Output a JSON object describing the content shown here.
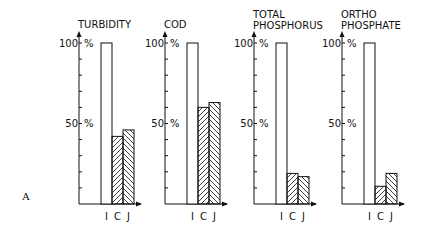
{
  "figure_label": "A",
  "chart_data": [
    {
      "type": "bar",
      "title": "TURBIDITY",
      "title_lines": [
        "TURBIDITY"
      ],
      "categories": [
        "I",
        "C",
        "J"
      ],
      "values": [
        100,
        42,
        46
      ],
      "ylim": [
        0,
        100
      ],
      "yticks": [
        {
          "value": 100,
          "label": "100",
          "unit": "%"
        },
        {
          "value": 50,
          "label": "50",
          "unit": "%"
        }
      ],
      "xlabel": "",
      "ylabel": ""
    },
    {
      "type": "bar",
      "title": "COD",
      "title_lines": [
        "COD"
      ],
      "categories": [
        "I",
        "C",
        "J"
      ],
      "values": [
        100,
        60,
        63
      ],
      "ylim": [
        0,
        100
      ],
      "yticks": [
        {
          "value": 100,
          "label": "100",
          "unit": "%"
        },
        {
          "value": 50,
          "label": "50",
          "unit": "%"
        }
      ],
      "xlabel": "",
      "ylabel": ""
    },
    {
      "type": "bar",
      "title": "TOTAL PHOSPHORUS",
      "title_lines": [
        "TOTAL",
        "PHOSPHORUS"
      ],
      "categories": [
        "I",
        "C",
        "J"
      ],
      "values": [
        100,
        19,
        17
      ],
      "ylim": [
        0,
        100
      ],
      "yticks": [
        {
          "value": 100,
          "label": "100",
          "unit": "%"
        },
        {
          "value": 50,
          "label": "50",
          "unit": "%"
        }
      ],
      "xlabel": "",
      "ylabel": ""
    },
    {
      "type": "bar",
      "title": "ORTHO PHOSPHATE",
      "title_lines": [
        "ORTHO",
        "PHOSPHATE"
      ],
      "categories": [
        "I",
        "C",
        "J"
      ],
      "values": [
        100,
        11,
        19
      ],
      "ylim": [
        0,
        100
      ],
      "yticks": [
        {
          "value": 100,
          "label": "100",
          "unit": "%"
        },
        {
          "value": 50,
          "label": "50",
          "unit": "%"
        }
      ],
      "xlabel": "",
      "ylabel": ""
    }
  ]
}
